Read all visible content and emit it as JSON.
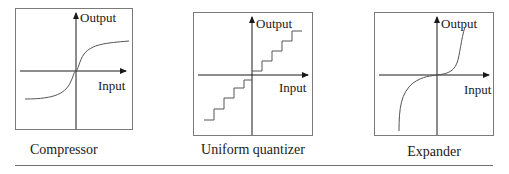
{
  "figure": {
    "panels": [
      {
        "id": "compressor",
        "caption": "Compressor",
        "axis_labels": {
          "y": "Output",
          "x": "Input"
        },
        "curve_type": "s-curve (compressive, saturating)"
      },
      {
        "id": "uniform-quantizer",
        "caption": "Uniform quantizer",
        "axis_labels": {
          "y": "Output",
          "x": "Input"
        },
        "curve_type": "staircase (uniform steps)"
      },
      {
        "id": "expander",
        "caption": "Expander",
        "axis_labels": {
          "y": "Output",
          "x": "Input"
        },
        "curve_type": "inverse s-curve (expansive)"
      }
    ]
  },
  "colors": {
    "line": "#1a1a1a",
    "frame": "#7a7a7a",
    "curve": "#555555",
    "rule": "#6e6e6e"
  }
}
